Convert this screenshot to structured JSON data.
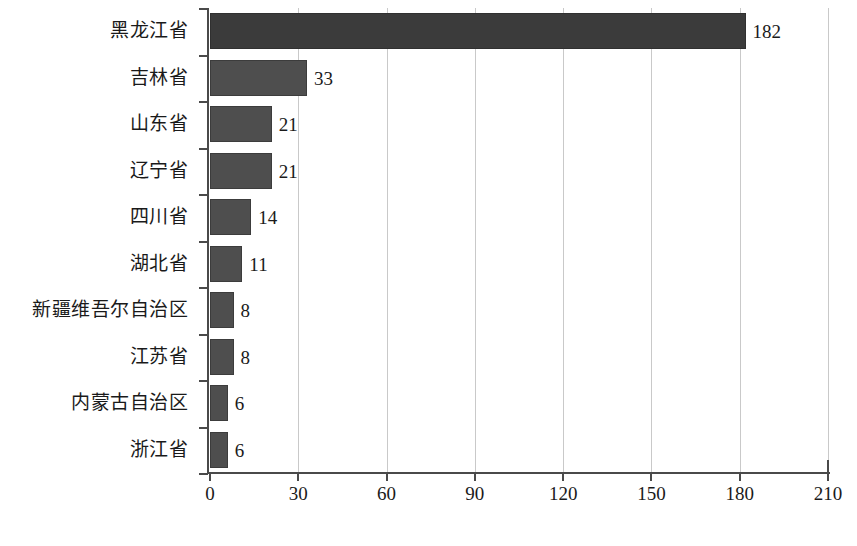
{
  "chart_data": {
    "type": "bar",
    "orientation": "horizontal",
    "title": "",
    "subtitle": "",
    "xlabel": "",
    "ylabel": "",
    "categories": [
      "黑龙江省",
      "吉林省",
      "山东省",
      "辽宁省",
      "四川省",
      "湖北省",
      "新疆维吾尔自治区",
      "江苏省",
      "内蒙古自治区",
      "浙江省"
    ],
    "values": [
      182,
      33,
      21,
      21,
      14,
      11,
      8,
      8,
      6,
      6
    ],
    "value_labels": [
      "182",
      "33",
      "21",
      "21",
      "14",
      "11",
      "8",
      "8",
      "6",
      "6"
    ],
    "xlim": [
      0,
      210
    ],
    "x_ticks": [
      0,
      30,
      60,
      90,
      120,
      150,
      180,
      210
    ],
    "x_tick_labels": [
      "0",
      "30",
      "60",
      "90",
      "120",
      "150",
      "180",
      "210"
    ],
    "grid": "vertical",
    "legend": "none",
    "series": [
      {
        "name": "",
        "values": [
          182,
          33,
          21,
          21,
          14,
          11,
          8,
          8,
          6,
          6
        ]
      }
    ]
  },
  "style": {
    "bar_color": "#4e4e4e",
    "bar_color_max": "#3b3b3b",
    "axis_color": "#4a4a4a",
    "gridline_color": "#c9c9c9",
    "background": "#ffffff",
    "text_color": "#1a1a1a"
  },
  "caption": {
    "text": ""
  }
}
